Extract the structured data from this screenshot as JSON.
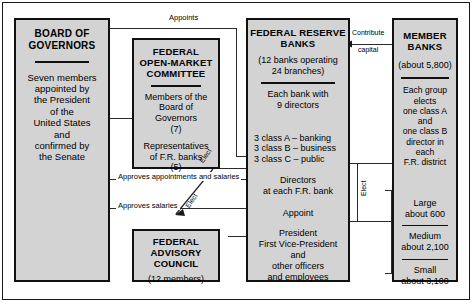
{
  "figure": {
    "kind": "organization-flow-diagram"
  },
  "boxes": {
    "board_of_governors": {
      "title_line1": "BOARD OF",
      "title_line2": "GOVERNORS",
      "body": "Seven members appointed by the President of the United States and confirmed by the Senate",
      "body_lines": [
        "Seven members",
        "appointed by",
        "the President",
        "of the",
        "United States",
        "and",
        "confirmed by",
        "the Senate"
      ]
    },
    "fomc": {
      "title_lines": [
        "FEDERAL",
        "OPEN-MARKET",
        "COMMITTEE"
      ],
      "body_lines": [
        "Members of the",
        "Board of",
        "Governors",
        "(7)"
      ],
      "body_lines2": [
        "Representatives",
        "of F.R. banks",
        "(5)"
      ]
    },
    "federal_advisory_council": {
      "title_lines": [
        "FEDERAL",
        "ADVISORY",
        "COUNCIL"
      ],
      "members": "(12 members)"
    },
    "federal_reserve_banks": {
      "title_line1": "FEDERAL RESERVE",
      "title_line2": "BANKS",
      "count_lines": [
        "(12 banks operating",
        "24 branches)"
      ],
      "directors_lines": [
        "Each bank with",
        "9 directors"
      ],
      "classes": [
        "3 class A – banking",
        "3 class B – business",
        "3 class C – public"
      ],
      "directors_at_lines": [
        "Directors",
        "at each F.R. bank"
      ],
      "appoint": "Appoint",
      "officers_lines": [
        "President",
        "First Vice-President",
        "and",
        "other officers",
        "and employees"
      ]
    },
    "member_banks": {
      "title_line1": "MEMBER",
      "title_line2": "BANKS",
      "count": "(about 5,800)",
      "elects_lines": [
        "Each group elects",
        "one class A and",
        "one class B",
        "director in each",
        "F.R. district"
      ],
      "groups": [
        {
          "name": "Large",
          "count": "about 600"
        },
        {
          "name": "Medium",
          "count": "about 2,100"
        },
        {
          "name": "Small",
          "count": "about 3,100"
        }
      ]
    }
  },
  "connectors": {
    "appoints": "Appoints",
    "contribute_line1": "Contribute",
    "contribute_line2": "capital",
    "approves_appointments": "Approves appointments and salaries",
    "approves_salaries": "Approves salaries",
    "elect_fomc": "Elect",
    "elect_fac": "Elect",
    "elect_member": "Elect"
  },
  "colors": {
    "box_fill": "#d3d3d3",
    "box_border": "#111111",
    "line": "#2b2b2b",
    "page": "#ffffff",
    "text": "#000000"
  }
}
